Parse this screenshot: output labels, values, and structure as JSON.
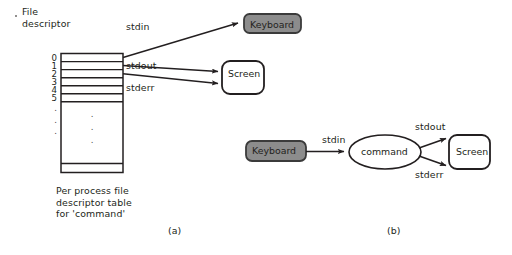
{
  "figure": {
    "title_a": "File\ndescriptor",
    "caption_a": "Per process file\ndescriptor table\nfor 'command'",
    "label_a": "(a)",
    "label_b": "(b)"
  },
  "colors": {
    "stroke": "#231f20",
    "keyboard_fill": "#8c8c8c",
    "keyboard_stroke": "#3b3b3b",
    "box_fill": "#ffffff",
    "text": "#231f20",
    "page_bg": "#ffffff"
  },
  "part_a": {
    "fd_table": {
      "indices": [
        "0",
        "1",
        "2",
        "3",
        "4",
        "5"
      ],
      "continuation_dots": [
        ".",
        ".",
        "."
      ],
      "cell_dots": [
        ".",
        ".",
        "."
      ]
    },
    "streams": [
      {
        "name": "stdin",
        "label": "stdin",
        "from_fd": "0",
        "to": "Keyboard"
      },
      {
        "name": "stdout",
        "label": "stdout",
        "from_fd": "1",
        "to": "Screen"
      },
      {
        "name": "stderr",
        "label": "stderr",
        "from_fd": "2",
        "to": "Screen"
      }
    ],
    "devices": [
      {
        "name": "keyboard",
        "label": "Keyboard",
        "fill": "gray"
      },
      {
        "name": "screen",
        "label": "Screen",
        "fill": "white"
      }
    ]
  },
  "part_b": {
    "nodes": [
      {
        "name": "keyboard",
        "label": "Keyboard",
        "shape": "rounded-rect",
        "fill": "gray"
      },
      {
        "name": "command",
        "label": "command",
        "shape": "ellipse",
        "fill": "white"
      },
      {
        "name": "screen",
        "label": "Screen",
        "shape": "rounded-rect",
        "fill": "white"
      }
    ],
    "edges": [
      {
        "name": "stdin",
        "label": "stdin",
        "from": "keyboard",
        "to": "command"
      },
      {
        "name": "stdout",
        "label": "stdout",
        "from": "command",
        "to": "screen"
      },
      {
        "name": "stderr",
        "label": "stderr",
        "from": "command",
        "to": "screen"
      }
    ]
  }
}
